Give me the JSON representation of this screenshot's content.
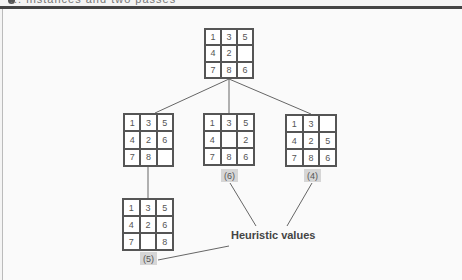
{
  "header": {
    "title": "... instances and two passes"
  },
  "diagram": {
    "caption": "Heuristic values",
    "nodes": [
      {
        "id": "root",
        "cells": [
          "1",
          "3",
          "5",
          "4",
          "2",
          "",
          "7",
          "8",
          "6"
        ],
        "heuristic": null
      },
      {
        "id": "left",
        "cells": [
          "1",
          "3",
          "5",
          "4",
          "2",
          "6",
          "7",
          "8",
          ""
        ],
        "heuristic": null
      },
      {
        "id": "middle",
        "cells": [
          "1",
          "3",
          "5",
          "4",
          "",
          "2",
          "7",
          "8",
          "6"
        ],
        "heuristic": "(6)"
      },
      {
        "id": "right",
        "cells": [
          "1",
          "3",
          "",
          "4",
          "2",
          "5",
          "7",
          "8",
          "6"
        ],
        "heuristic": "(4)"
      },
      {
        "id": "left-child",
        "cells": [
          "1",
          "3",
          "5",
          "4",
          "2",
          "6",
          "7",
          "",
          "8"
        ],
        "heuristic": "(5)"
      }
    ]
  },
  "colors": {
    "line": "#555555",
    "label_bg": "#d6d6d6",
    "rule": "#444444"
  }
}
